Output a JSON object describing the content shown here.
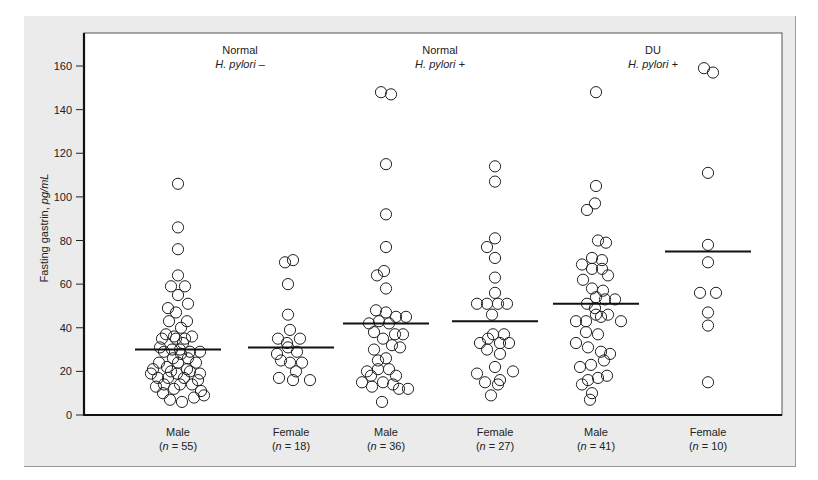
{
  "chart_data": {
    "type": "scatter",
    "subtype": "dot-plot with median lines",
    "title": "",
    "xlabel": "",
    "ylabel": "Fasting gastrin, pg/mL",
    "ylabel_plain": "Fasting gastrin, ",
    "ylabel_italic": "pg/mL",
    "ylim": [
      0,
      170
    ],
    "yticks": [
      0,
      20,
      40,
      60,
      80,
      100,
      120,
      140,
      160
    ],
    "grid": false,
    "legend": null,
    "panel_headers": [
      {
        "line1": "Normal",
        "line2": "H. pylori –",
        "center_x": 240
      },
      {
        "line1": "Normal",
        "line2": "H. pylori +",
        "center_x": 440
      },
      {
        "line1": "DU",
        "line2": "H. pylori +",
        "center_x": 653
      }
    ],
    "groups": [
      {
        "name": "Male",
        "n_label": "(n = 55)",
        "n": 55,
        "center_x": 178,
        "median": 30,
        "points": [
          [
            0,
            106
          ],
          [
            0,
            86
          ],
          [
            0,
            76
          ],
          [
            0,
            64
          ],
          [
            -7,
            59
          ],
          [
            7,
            59
          ],
          [
            0,
            55
          ],
          [
            10,
            51
          ],
          [
            -10,
            49
          ],
          [
            -2,
            47
          ],
          [
            -9,
            43
          ],
          [
            9,
            43
          ],
          [
            3,
            40
          ],
          [
            -12,
            37
          ],
          [
            -4,
            36
          ],
          [
            7,
            35
          ],
          [
            -18,
            31
          ],
          [
            -6,
            30
          ],
          [
            -14,
            29
          ],
          [
            2,
            30
          ],
          [
            12,
            29
          ],
          [
            22,
            29
          ],
          [
            -25,
            21
          ],
          [
            -20,
            17
          ],
          [
            -10,
            17
          ],
          [
            -1,
            19
          ],
          [
            9,
            21
          ],
          [
            18,
            24
          ],
          [
            22,
            19
          ],
          [
            -27,
            19
          ],
          [
            -14,
            14
          ],
          [
            2,
            14
          ],
          [
            14,
            14
          ],
          [
            -4,
            12
          ],
          [
            23,
            11
          ],
          [
            -8,
            7
          ],
          [
            4,
            6
          ],
          [
            -15,
            10
          ],
          [
            0,
            24
          ],
          [
            -5,
            26
          ],
          [
            10,
            26
          ],
          [
            5,
            33
          ],
          [
            -19,
            24
          ],
          [
            12,
            20
          ],
          [
            20,
            16
          ],
          [
            -22,
            13
          ],
          [
            16,
            8
          ],
          [
            26,
            9
          ],
          [
            -11,
            22
          ],
          [
            6,
            17
          ],
          [
            -2,
            35
          ],
          [
            14,
            36
          ],
          [
            -16,
            35
          ],
          [
            3,
            28
          ],
          [
            -7,
            20
          ]
        ]
      },
      {
        "name": "Female",
        "n_label": "(n = 18)",
        "n": 18,
        "center_x": 291,
        "median": 31,
        "points": [
          [
            -6,
            70
          ],
          [
            2,
            71
          ],
          [
            -3,
            60
          ],
          [
            -3,
            46
          ],
          [
            -1,
            39
          ],
          [
            -13,
            35
          ],
          [
            9,
            35
          ],
          [
            -4,
            33
          ],
          [
            -14,
            28
          ],
          [
            -3,
            31
          ],
          [
            6,
            29
          ],
          [
            -10,
            25
          ],
          [
            -1,
            24
          ],
          [
            11,
            24
          ],
          [
            5,
            20
          ],
          [
            -12,
            17
          ],
          [
            2,
            16
          ],
          [
            19,
            16
          ]
        ]
      },
      {
        "name": "Male",
        "n_label": "(n = 36)",
        "n": 36,
        "center_x": 386,
        "median": 42,
        "points": [
          [
            -5,
            148
          ],
          [
            5,
            147
          ],
          [
            0,
            115
          ],
          [
            0,
            92
          ],
          [
            0,
            77
          ],
          [
            -2,
            66
          ],
          [
            -9,
            64
          ],
          [
            0,
            58
          ],
          [
            -10,
            48
          ],
          [
            0,
            47
          ],
          [
            10,
            45
          ],
          [
            20,
            45
          ],
          [
            -17,
            42
          ],
          [
            -7,
            43
          ],
          [
            3,
            42
          ],
          [
            -3,
            35
          ],
          [
            6,
            32
          ],
          [
            14,
            31
          ],
          [
            -12,
            30
          ],
          [
            0,
            26
          ],
          [
            -8,
            21
          ],
          [
            3,
            21
          ],
          [
            10,
            18
          ],
          [
            -15,
            18
          ],
          [
            -3,
            15
          ],
          [
            7,
            14
          ],
          [
            -24,
            15
          ],
          [
            -14,
            13
          ],
          [
            13,
            12
          ],
          [
            22,
            12
          ],
          [
            -4,
            6
          ],
          [
            -19,
            20
          ],
          [
            -8,
            25
          ],
          [
            9,
            37
          ],
          [
            -12,
            38
          ],
          [
            17,
            37
          ]
        ]
      },
      {
        "name": "Female",
        "n_label": "(n = 27)",
        "n": 27,
        "center_x": 495,
        "median": 43,
        "points": [
          [
            0,
            114
          ],
          [
            0,
            107
          ],
          [
            0,
            81
          ],
          [
            -8,
            77
          ],
          [
            0,
            72
          ],
          [
            0,
            63
          ],
          [
            0,
            56
          ],
          [
            -18,
            51
          ],
          [
            -8,
            51
          ],
          [
            3,
            51
          ],
          [
            12,
            51
          ],
          [
            -3,
            46
          ],
          [
            -2,
            37
          ],
          [
            9,
            37
          ],
          [
            -7,
            35
          ],
          [
            5,
            33
          ],
          [
            -15,
            33
          ],
          [
            14,
            33
          ],
          [
            -8,
            30
          ],
          [
            5,
            28
          ],
          [
            0,
            22
          ],
          [
            -18,
            19
          ],
          [
            -10,
            15
          ],
          [
            5,
            16
          ],
          [
            18,
            20
          ],
          [
            3,
            14
          ],
          [
            -4,
            9
          ]
        ]
      },
      {
        "name": "Male",
        "n_label": "(n = 41)",
        "n": 41,
        "center_x": 596,
        "median": 51,
        "points": [
          [
            0,
            148
          ],
          [
            0,
            105
          ],
          [
            -9,
            94
          ],
          [
            -1,
            97
          ],
          [
            2,
            80
          ],
          [
            10,
            79
          ],
          [
            -4,
            72
          ],
          [
            6,
            71
          ],
          [
            -14,
            69
          ],
          [
            -4,
            67
          ],
          [
            6,
            67
          ],
          [
            12,
            64
          ],
          [
            -13,
            62
          ],
          [
            -4,
            58
          ],
          [
            7,
            57
          ],
          [
            0,
            54
          ],
          [
            9,
            53
          ],
          [
            19,
            53
          ],
          [
            -9,
            51
          ],
          [
            -1,
            49
          ],
          [
            5,
            45
          ],
          [
            -20,
            43
          ],
          [
            -10,
            43
          ],
          [
            0,
            46
          ],
          [
            12,
            46
          ],
          [
            25,
            43
          ],
          [
            -10,
            38
          ],
          [
            2,
            37
          ],
          [
            -20,
            33
          ],
          [
            -8,
            31
          ],
          [
            5,
            29
          ],
          [
            14,
            28
          ],
          [
            -16,
            22
          ],
          [
            -5,
            23
          ],
          [
            8,
            25
          ],
          [
            -8,
            16
          ],
          [
            2,
            17
          ],
          [
            11,
            18
          ],
          [
            -14,
            14
          ],
          [
            -4,
            10
          ],
          [
            -6,
            7
          ]
        ]
      },
      {
        "name": "Female",
        "n_label": "(n = 10)",
        "n": 10,
        "center_x": 708,
        "median": 75,
        "points": [
          [
            -4,
            159
          ],
          [
            5,
            157
          ],
          [
            0,
            111
          ],
          [
            0,
            78
          ],
          [
            0,
            70
          ],
          [
            -8,
            56
          ],
          [
            8,
            56
          ],
          [
            0,
            47
          ],
          [
            0,
            41
          ],
          [
            0,
            15
          ]
        ]
      }
    ]
  }
}
